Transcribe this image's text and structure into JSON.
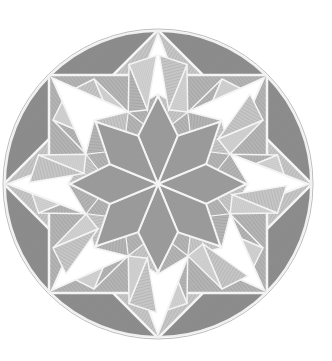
{
  "figure": {
    "center": [
      158,
      184
    ],
    "radius": 154,
    "colors": {
      "background": "#ffffff",
      "outer_segments": "#8c8c8c",
      "rhombus_star": "#9a9a9a",
      "hatched_light": "#c4c4c4",
      "hatched_mid": "#adadad",
      "white_points": "#ffffff",
      "lines": "#f4f4f4",
      "rim": "#bdbdbd"
    }
  }
}
